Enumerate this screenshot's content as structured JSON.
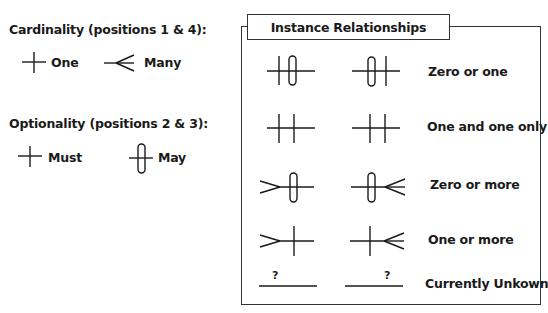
{
  "legend": {
    "cardinality": {
      "heading": "Cardinality (positions 1 & 4):",
      "items": [
        {
          "symbol": "one-bar",
          "label": "One"
        },
        {
          "symbol": "crows-foot",
          "label": "Many"
        }
      ]
    },
    "optionality": {
      "heading": "Optionality (positions 2 & 3):",
      "items": [
        {
          "symbol": "bar",
          "label": "Must"
        },
        {
          "symbol": "oval",
          "label": "May"
        }
      ]
    }
  },
  "instance_relationships": {
    "title": "Instance Relationships",
    "rows": [
      {
        "left": "bar-oval",
        "right": "oval-bar",
        "label": "Zero or one"
      },
      {
        "left": "bar-bar",
        "right": "bar-bar",
        "label": "One and one only"
      },
      {
        "left": "crowsfoot-oval",
        "right": "oval-crowsfoot",
        "label": "Zero or more"
      },
      {
        "left": "crowsfoot-bar",
        "right": "bar-crowsfoot",
        "label": "One or more"
      },
      {
        "left": "unknown",
        "right": "unknown",
        "label": "Currently Unkown",
        "marker": "?"
      }
    ]
  }
}
